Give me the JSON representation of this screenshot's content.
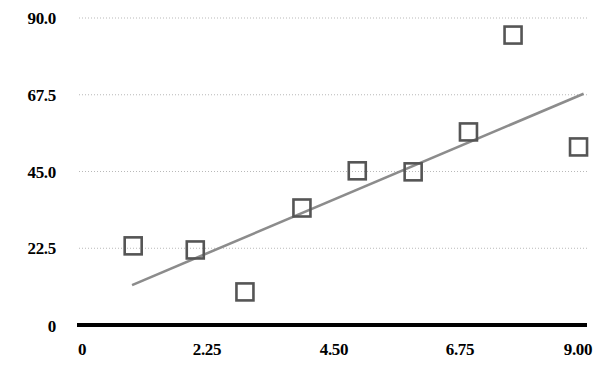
{
  "chart_data": {
    "type": "scatter",
    "title": "",
    "subtitle": "",
    "xlabel": "",
    "ylabel": "",
    "xlim": [
      0,
      9.0
    ],
    "ylim": [
      0,
      90.0
    ],
    "grid": true,
    "grid_axis": "y",
    "legend": false,
    "legend_position": "none",
    "x_ticks": [
      0,
      2.25,
      4.5,
      6.75,
      9.0
    ],
    "x_tick_labels": [
      "0",
      "2.25",
      "4.50",
      "6.75",
      "9.00"
    ],
    "y_ticks": [
      0,
      22.5,
      45.0,
      67.5,
      90.0
    ],
    "y_tick_labels": [
      "0",
      "22.5",
      "45.0",
      "67.5",
      "90.0"
    ],
    "marker": "open-square",
    "marker_color": "#555555",
    "marker_size": 17,
    "series": [
      {
        "name": "data",
        "type": "scatter",
        "points": [
          {
            "x": 0.96,
            "y": 23.2
          },
          {
            "x": 2.06,
            "y": 22.0
          },
          {
            "x": 2.94,
            "y": 9.7
          },
          {
            "x": 3.95,
            "y": 34.3
          },
          {
            "x": 4.93,
            "y": 45.2
          },
          {
            "x": 5.92,
            "y": 44.9
          },
          {
            "x": 6.9,
            "y": 56.6
          },
          {
            "x": 7.69,
            "y": 85.0
          },
          {
            "x": 8.85,
            "y": 52.2
          }
        ]
      },
      {
        "name": "trendline",
        "type": "line",
        "color": "#8c8c8c",
        "points": [
          {
            "x": 0.94,
            "y": 11.7
          },
          {
            "x": 8.94,
            "y": 67.8
          }
        ]
      }
    ],
    "axis_color": "#000000",
    "gridline_color": "#b9b9b9"
  },
  "axes": {
    "y_labels": [
      "90.0",
      "67.5",
      "45.0",
      "22.5",
      "0"
    ],
    "x_labels": [
      "0",
      "2.25",
      "4.50",
      "6.75",
      "9.00"
    ]
  }
}
